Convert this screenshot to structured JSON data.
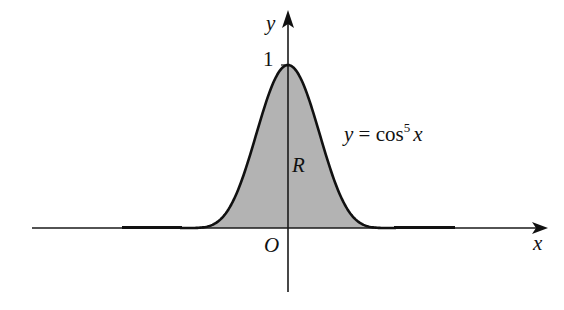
{
  "diagram": {
    "type": "function-graph",
    "function": "y = cos^5 x",
    "colors": {
      "axis": "#1a1a1a",
      "curve": "#111111",
      "region_fill": "#b3b3b3",
      "background": "#ffffff"
    },
    "labels": {
      "y_axis": "y",
      "x_axis": "x",
      "origin": "O",
      "y_tick_one": "1",
      "region": "R",
      "curve_label_lhs": "y = cos",
      "curve_label_exp": "5",
      "curve_label_var": "x"
    },
    "geometry": {
      "origin_px": [
        288,
        228
      ],
      "peak_px": [
        288,
        65
      ],
      "half_width_px": 108,
      "x_axis_range_px": [
        32,
        548
      ],
      "y_axis_range_px": [
        10,
        292
      ],
      "tail_left_px": [
        122,
        180
      ],
      "tail_right_px": [
        396,
        455
      ]
    }
  }
}
